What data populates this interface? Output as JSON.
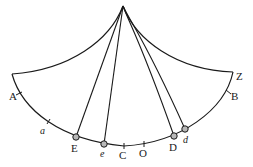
{
  "figure": {
    "apex": {
      "x": 123,
      "y": 6
    },
    "colors": {
      "line": "#1a1a1a",
      "bob_fill": "#b8b8b8",
      "background": "#ffffff"
    }
  },
  "labels": {
    "A": "A",
    "a": "a",
    "E": "E",
    "e": "e",
    "C": "C",
    "O": "O",
    "D": "D",
    "d": "d",
    "B": "B",
    "Z": "Z"
  },
  "bobs": [
    {
      "id": "E",
      "x": 76,
      "y": 137
    },
    {
      "id": "e",
      "x": 104,
      "y": 144
    },
    {
      "id": "D",
      "x": 174,
      "y": 136
    },
    {
      "id": "d",
      "x": 185,
      "y": 129
    }
  ],
  "tick_marks": [
    "A",
    "a",
    "C",
    "O",
    "B"
  ]
}
